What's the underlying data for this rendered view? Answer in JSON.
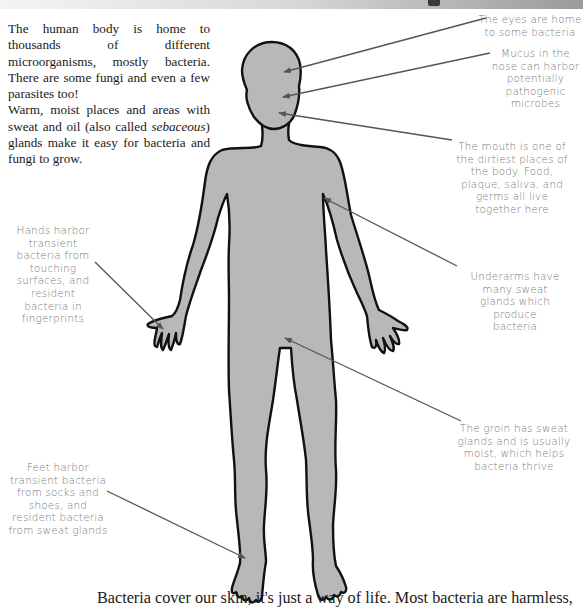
{
  "intro": {
    "paragraph_1": "The human body is home to thousands of different microorganisms, mostly bacteria. There are some fungi and even a few parasites too!",
    "paragraph_2_before": "Warm, moist places and areas with sweat and oil (also called ",
    "paragraph_2_em": "sebaceous",
    "paragraph_2_after": ") glands make it easy for bacteria and fungi to grow."
  },
  "callouts": {
    "eyes": "The eyes are home to some bacteria",
    "nose": "Mucus in the nose can harbor potentially pathogenic microbes",
    "mouth": "The mouth is one of the dirtiest places of the body. Food, plaque, saliva, and germs all live together here",
    "underarms": "Underarms have many sweat glands which produce bacteria",
    "hands": "Hands harbor transient bacteria from touching surfaces, and resident bacteria in fingerprints",
    "groin": "The groin has sweat glands and is usually moist, which helps bacteria thrive",
    "feet": "Feet harbor transient bacteria from socks and shoes, and resident bacteria from sweat glands"
  },
  "footer": {
    "text": "Bacteria cover our skin, it's just a way of life. Most bacteria are harmless,"
  },
  "colors": {
    "body_fill": "#b8b8b8",
    "body_outline": "#111111",
    "arrow": "#555555",
    "callout_text": "#7a7a7a",
    "body_text": "#1a1a1a"
  },
  "icons": {
    "body": "human-body-silhouette",
    "arrow": "arrow-pointer"
  }
}
